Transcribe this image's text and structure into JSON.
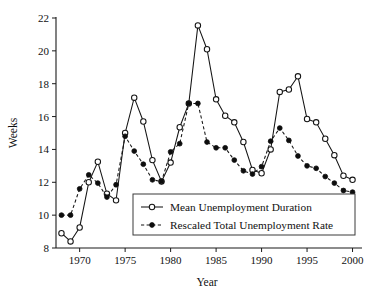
{
  "chart_data": {
    "type": "line",
    "title": "",
    "subtitle": "",
    "xlabel": "Year",
    "ylabel": "Weeks",
    "xlim": [
      1967.4,
      2000.6
    ],
    "ylim": [
      8,
      22
    ],
    "xticks": [
      1970,
      1975,
      1980,
      1985,
      1990,
      1995,
      2000
    ],
    "xticklabels": [
      "1970",
      "1975",
      "1980",
      "1985",
      "1990",
      "1995",
      "2000"
    ],
    "yticks": [
      8,
      10,
      12,
      14,
      16,
      18,
      20,
      22
    ],
    "yticklabels": [
      "8",
      "10",
      "12",
      "14",
      "16",
      "18",
      "20",
      "22"
    ],
    "grid": false,
    "legend_position": "lower-center",
    "x": [
      1968,
      1969,
      1970,
      1971,
      1972,
      1973,
      1974,
      1975,
      1976,
      1977,
      1978,
      1979,
      1980,
      1981,
      1982,
      1983,
      1984,
      1985,
      1986,
      1987,
      1988,
      1989,
      1990,
      1991,
      1992,
      1993,
      1994,
      1995,
      1996,
      1997,
      1998,
      1999,
      2000
    ],
    "series": [
      {
        "name": "Mean Unemployment Duration",
        "marker": "open-circle",
        "linestyle": "solid",
        "color": "#141414",
        "values": [
          8.9,
          8.4,
          9.25,
          12.0,
          13.25,
          11.3,
          10.9,
          15.0,
          17.15,
          15.7,
          13.35,
          12.05,
          13.2,
          15.35,
          16.8,
          21.55,
          20.1,
          17.05,
          16.05,
          15.65,
          14.45,
          12.75,
          12.55,
          14.0,
          17.5,
          17.65,
          18.45,
          15.85,
          15.65,
          14.65,
          13.65,
          12.4,
          12.15
        ]
      },
      {
        "name": "Rescaled Total Unemployment Rate",
        "marker": "filled-circle",
        "linestyle": "dashed",
        "color": "#0d0d0d",
        "values": [
          10.0,
          10.0,
          11.6,
          12.45,
          11.95,
          11.1,
          11.85,
          14.8,
          13.9,
          13.1,
          12.15,
          12.05,
          13.85,
          14.35,
          16.8,
          16.8,
          14.45,
          14.1,
          14.1,
          13.35,
          12.7,
          12.5,
          12.95,
          14.5,
          15.3,
          14.55,
          13.6,
          13.0,
          12.85,
          12.35,
          11.95,
          11.5,
          11.4
        ]
      }
    ]
  }
}
